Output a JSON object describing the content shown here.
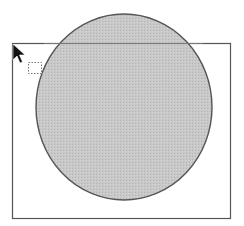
{
  "canvas": {
    "width": 244,
    "height": 226,
    "background": "#ffffff"
  },
  "frame_rect": {
    "x": 12,
    "y": 43,
    "width": 219,
    "height": 176,
    "stroke": "#555555"
  },
  "ellipse": {
    "cx": 124,
    "cy": 107,
    "rx": 88,
    "ry": 93,
    "fill": "#c8c8c8",
    "stroke": "#555555"
  },
  "selection_marquee": {
    "x": 28,
    "y": 62,
    "width": 13,
    "height": 11,
    "stroke": "#777777"
  },
  "cursor": {
    "icon": "arrow-pointer-icon",
    "x": 13,
    "y": 44,
    "color": "#111111"
  }
}
